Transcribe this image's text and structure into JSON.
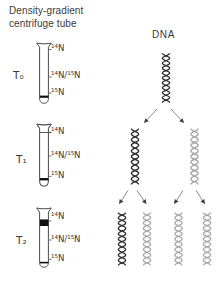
{
  "title": {
    "line1": "Density-gradient",
    "line2": "centrifuge tube"
  },
  "dna_heading": "DNA",
  "colors": {
    "text": "#3a3a3a",
    "tube_outline": "#4a4a4a",
    "band": "#111111",
    "band_thin": "#555555",
    "tick": "#666666",
    "dark_dna": "#2f2f2f",
    "light_dna": "#a9a9a9",
    "arrow_line": "#8a8a8a",
    "arrow_head": "#3f3f3f"
  },
  "timepoints": [
    {
      "label": "T₀",
      "gradient_labels": [
        "¹⁴N",
        "¹⁴N/¹⁵N",
        "¹⁵N"
      ],
      "bands": [
        {
          "level": "¹⁵N",
          "weight": "medium"
        }
      ],
      "helices": [
        "dark"
      ]
    },
    {
      "label": "T₁",
      "gradient_labels": [
        "¹⁴N",
        "¹⁴N/¹⁵N",
        "¹⁵N"
      ],
      "bands": [
        {
          "level": "¹⁴N",
          "weight": "thin"
        },
        {
          "level": "¹⁵N",
          "weight": "medium"
        }
      ],
      "helices": [
        "dark",
        "light"
      ]
    },
    {
      "label": "T₂",
      "gradient_labels": [
        "¹⁴N",
        "¹⁴N/¹⁵N",
        "¹⁵N"
      ],
      "bands": [
        {
          "level": "¹⁴N",
          "weight": "thick"
        },
        {
          "level": "¹⁵N",
          "weight": "thin"
        }
      ],
      "helices": [
        "dark",
        "light",
        "light",
        "light"
      ]
    }
  ]
}
